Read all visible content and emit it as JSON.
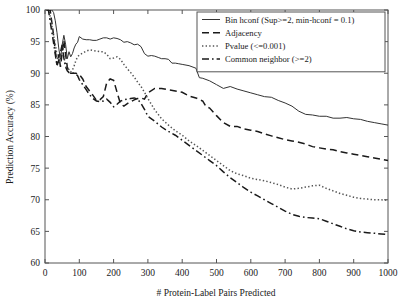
{
  "chart_data": {
    "type": "line",
    "title": "",
    "xlabel": "# Protein-Label Pairs Predicted",
    "ylabel": "Prediction Accuracy (%)",
    "xlim": [
      0,
      1000
    ],
    "ylim": [
      60,
      100
    ],
    "xticks": [
      0,
      100,
      200,
      300,
      400,
      500,
      600,
      700,
      800,
      900,
      1000
    ],
    "yticks": [
      60,
      65,
      70,
      75,
      80,
      85,
      90,
      95,
      100
    ],
    "grid": false,
    "legend_position": "top-right",
    "legend_entries": [
      "Bin hconf (Sup>=2, min-hconf = 0.1)",
      "Adjacency",
      "Pvalue (<=0.001)",
      "Common neighbor (>=2)"
    ],
    "series": [
      {
        "name": "Bin hconf (Sup>=2, min-hconf = 0.1)",
        "style": "solid",
        "color": "#333333",
        "x": [
          5,
          10,
          15,
          20,
          25,
          30,
          35,
          40,
          45,
          50,
          55,
          60,
          65,
          70,
          75,
          80,
          85,
          90,
          95,
          100,
          110,
          120,
          130,
          140,
          150,
          160,
          170,
          180,
          190,
          200,
          210,
          220,
          230,
          240,
          250,
          260,
          270,
          280,
          290,
          300,
          310,
          320,
          330,
          340,
          350,
          360,
          370,
          380,
          390,
          400,
          420,
          440,
          450,
          460,
          480,
          500,
          520,
          540,
          560,
          580,
          600,
          620,
          640,
          660,
          680,
          700,
          720,
          740,
          760,
          780,
          800,
          820,
          840,
          860,
          880,
          900,
          920,
          940,
          960,
          980,
          1000
        ],
        "y": [
          100,
          100,
          100,
          100,
          99.6,
          98.3,
          96.4,
          94.0,
          92.2,
          94.5,
          96.0,
          94.6,
          92.3,
          93.4,
          92.6,
          93.1,
          94.0,
          94.6,
          94.9,
          95.8,
          95.4,
          95.3,
          95.3,
          95.2,
          95.2,
          95.4,
          95.6,
          95.6,
          95.4,
          95.6,
          95.5,
          95.3,
          94.9,
          95.0,
          94.8,
          94.5,
          94.6,
          94.2,
          93.1,
          92.7,
          92.8,
          92.7,
          92.5,
          92.3,
          92.3,
          92.2,
          91.6,
          91.6,
          91.5,
          91.4,
          91.2,
          90.8,
          89.3,
          89.2,
          88.8,
          88.2,
          87.6,
          87.9,
          87.5,
          87.2,
          86.9,
          86.6,
          86.3,
          86.2,
          85.7,
          85.3,
          84.8,
          84.0,
          83.5,
          83.4,
          83.2,
          83.2,
          82.9,
          82.9,
          83.0,
          82.8,
          82.7,
          82.4,
          82.2,
          82.0,
          81.8
        ]
      },
      {
        "name": "Adjacency",
        "style": "dashed",
        "color": "#1a1a1a",
        "x": [
          5,
          10,
          15,
          20,
          25,
          30,
          35,
          40,
          45,
          50,
          55,
          60,
          65,
          70,
          75,
          80,
          85,
          90,
          95,
          100,
          110,
          120,
          130,
          140,
          150,
          160,
          170,
          180,
          190,
          200,
          210,
          220,
          230,
          240,
          250,
          260,
          270,
          280,
          290,
          300,
          320,
          340,
          360,
          380,
          400,
          420,
          440,
          460,
          470,
          480,
          500,
          520,
          540,
          560,
          580,
          600,
          620,
          640,
          660,
          680,
          700,
          720,
          740,
          760,
          780,
          800,
          820,
          840,
          860,
          880,
          900,
          920,
          940,
          960,
          980,
          1000
        ],
        "y": [
          100,
          100,
          100,
          98.0,
          96.0,
          93.5,
          91.3,
          93.0,
          91.0,
          93.2,
          95.2,
          93.0,
          91.0,
          90.2,
          90.0,
          90.0,
          90.0,
          90.0,
          89.9,
          89.8,
          89.1,
          87.9,
          87.2,
          86.5,
          85.7,
          85.8,
          86.3,
          88.5,
          89.1,
          88.9,
          87.0,
          85.2,
          84.8,
          85.2,
          85.5,
          85.8,
          86.0,
          86.1,
          85.9,
          86.9,
          87.6,
          87.6,
          87.4,
          87.2,
          87.0,
          86.4,
          86.1,
          85.6,
          84.7,
          84.5,
          83.3,
          82.2,
          81.6,
          81.6,
          81.2,
          81.0,
          80.8,
          80.4,
          80.1,
          79.8,
          79.5,
          79.3,
          79.1,
          78.8,
          78.4,
          78.2,
          78.0,
          77.9,
          77.6,
          77.4,
          77.2,
          77.0,
          76.8,
          76.6,
          76.4,
          76.2
        ]
      },
      {
        "name": "Pvalue (<=0.001)",
        "style": "dotted",
        "color": "#555555",
        "x": [
          5,
          10,
          15,
          20,
          25,
          30,
          35,
          40,
          45,
          50,
          55,
          60,
          65,
          70,
          75,
          80,
          85,
          90,
          95,
          100,
          110,
          120,
          130,
          140,
          150,
          160,
          170,
          180,
          190,
          200,
          210,
          220,
          230,
          240,
          250,
          260,
          270,
          280,
          290,
          300,
          320,
          340,
          360,
          380,
          400,
          420,
          440,
          460,
          480,
          500,
          520,
          540,
          560,
          580,
          600,
          620,
          640,
          660,
          680,
          700,
          720,
          740,
          760,
          780,
          800,
          820,
          840,
          860,
          880,
          900,
          920,
          940,
          960,
          980,
          1000
        ],
        "y": [
          100,
          100,
          99.0,
          97.5,
          96.0,
          94.6,
          92.8,
          91.6,
          92.6,
          94.0,
          92.6,
          91.3,
          90.8,
          90.6,
          90.2,
          90.5,
          91.2,
          92.0,
          92.6,
          92.9,
          93.2,
          93.5,
          93.7,
          93.6,
          93.5,
          93.4,
          93.4,
          93.0,
          92.3,
          92.4,
          92.6,
          92.2,
          91.4,
          90.7,
          90.1,
          89.4,
          88.6,
          87.9,
          87.0,
          86.0,
          84.2,
          82.8,
          81.8,
          80.9,
          80.2,
          79.3,
          78.6,
          77.8,
          77.0,
          76.2,
          75.4,
          74.6,
          74.1,
          73.8,
          73.4,
          73.2,
          73.0,
          72.7,
          72.4,
          72.0,
          71.7,
          71.8,
          72.0,
          72.2,
          72.3,
          71.8,
          71.4,
          71.0,
          70.7,
          70.4,
          70.2,
          70.1,
          70.0,
          70.0,
          69.9
        ]
      },
      {
        "name": "Common neighbor (>=2)",
        "style": "dashdot",
        "color": "#1a1a1a",
        "x": [
          5,
          10,
          15,
          20,
          25,
          30,
          35,
          40,
          45,
          50,
          55,
          60,
          65,
          70,
          75,
          80,
          85,
          90,
          95,
          100,
          110,
          120,
          130,
          140,
          150,
          160,
          170,
          180,
          190,
          200,
          210,
          220,
          230,
          240,
          250,
          260,
          270,
          280,
          290,
          300,
          320,
          340,
          360,
          380,
          400,
          420,
          440,
          460,
          480,
          500,
          520,
          540,
          560,
          580,
          600,
          620,
          640,
          660,
          680,
          700,
          720,
          740,
          760,
          780,
          800,
          820,
          840,
          860,
          880,
          900,
          920,
          940,
          960,
          980,
          1000
        ],
        "y": [
          100,
          100,
          98.2,
          96.5,
          94.8,
          93.0,
          91.2,
          92.0,
          93.3,
          94.5,
          92.4,
          91.0,
          90.4,
          90.1,
          90.0,
          90.0,
          90.0,
          89.9,
          89.6,
          89.0,
          88.2,
          87.4,
          86.6,
          86.0,
          85.6,
          85.5,
          85.6,
          85.9,
          85.4,
          84.7,
          85.1,
          85.6,
          85.8,
          85.9,
          86.0,
          86.1,
          85.9,
          85.2,
          84.3,
          83.2,
          82.4,
          81.5,
          80.8,
          80.2,
          79.4,
          78.6,
          77.8,
          77.0,
          76.2,
          75.4,
          74.4,
          73.5,
          72.7,
          71.9,
          71.2,
          70.6,
          70.0,
          69.4,
          68.8,
          68.2,
          67.7,
          67.4,
          67.2,
          67.1,
          67.0,
          66.6,
          66.2,
          65.8,
          65.4,
          65.1,
          64.9,
          64.8,
          64.7,
          64.6,
          64.5
        ]
      }
    ]
  },
  "axes": {
    "ylabel": "Prediction Accuracy (%)",
    "xlabel": "# Protein-Label Pairs Predicted",
    "xtick_labels": [
      "0",
      "100",
      "200",
      "300",
      "400",
      "500",
      "600",
      "700",
      "800",
      "900",
      "1000"
    ],
    "ytick_labels": [
      "60",
      "65",
      "70",
      "75",
      "80",
      "85",
      "90",
      "95",
      "100"
    ]
  },
  "legend": {
    "items": [
      {
        "label": "Bin hconf (Sup>=2, min-hconf = 0.1)",
        "style": "solid"
      },
      {
        "label": "Adjacency",
        "style": "dashed"
      },
      {
        "label": "Pvalue (<=0.001)",
        "style": "dotted"
      },
      {
        "label": "Common neighbor (>=2)",
        "style": "dashdot"
      }
    ]
  },
  "colors": {
    "axis": "#555555",
    "text": "#1a1a1a",
    "series_solid": "#333333",
    "series_dashed": "#1a1a1a",
    "series_dotted": "#555555",
    "series_dashdot": "#1a1a1a",
    "background": "#ffffff"
  }
}
